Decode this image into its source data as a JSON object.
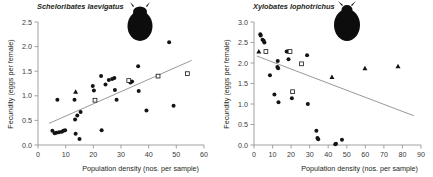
{
  "figure": {
    "panels": [
      {
        "id": "left",
        "title": "Scheloribates laevigatus",
        "icon_name": "mite-silhouette-icon",
        "chart_data": {
          "type": "scatter",
          "title": "Scheloribates laevigatus",
          "xlabel": "Population density (nos. per sample)",
          "ylabel": "Fecundity (eggs per female)",
          "xlim": [
            0,
            60
          ],
          "ylim": [
            0,
            2.5
          ],
          "xticks": [
            0,
            10,
            20,
            30,
            40,
            50,
            60
          ],
          "yticks": [
            "0.0",
            "0.5",
            "1.0",
            "1.5",
            "2.0",
            "2.5"
          ],
          "grid": false,
          "legend": "none",
          "series": [
            {
              "name": "circles",
              "marker": "filled-circle",
              "points": [
                [
                  5.2,
                  0.29
                ],
                [
                  6.0,
                  0.24
                ],
                [
                  6.6,
                  0.25
                ],
                [
                  7.0,
                  0.92
                ],
                [
                  7.6,
                  0.26
                ],
                [
                  8.6,
                  0.27
                ],
                [
                  9.2,
                  0.29
                ],
                [
                  9.8,
                  0.3
                ],
                [
                  13.2,
                  0.92
                ],
                [
                  13.4,
                  0.52
                ],
                [
                  13.6,
                  0.23
                ],
                [
                  14.2,
                  0.6
                ],
                [
                  15.0,
                  0.12
                ],
                [
                  15.4,
                  0.67
                ],
                [
                  19.8,
                  1.2
                ],
                [
                  20.2,
                  1.11
                ],
                [
                  22.8,
                  1.4
                ],
                [
                  23.0,
                  0.3
                ],
                [
                  24.4,
                  1.23
                ],
                [
                  25.6,
                  1.32
                ],
                [
                  26.8,
                  1.34
                ],
                [
                  27.6,
                  1.36
                ],
                [
                  27.8,
                  1.12
                ],
                [
                  28.4,
                  0.92
                ],
                [
                  33.4,
                  1.27
                ],
                [
                  34.0,
                  1.29
                ],
                [
                  36.2,
                  1.6
                ],
                [
                  36.4,
                  1.1
                ],
                [
                  39.2,
                  0.7
                ],
                [
                  47.4,
                  2.09
                ],
                [
                  49.0,
                  0.8
                ]
              ]
            },
            {
              "name": "triangles",
              "marker": "filled-triangle",
              "points": [
                [
                  13.6,
                  1.08
                ]
              ]
            },
            {
              "name": "squares",
              "marker": "open-square",
              "points": [
                [
                  20.6,
                  0.91
                ],
                [
                  32.8,
                  1.31
                ],
                [
                  43.4,
                  1.4
                ],
                [
                  54.0,
                  1.45
                ]
              ]
            }
          ],
          "trendline": {
            "x0": 4.0,
            "y0": 0.44,
            "x1": 55.5,
            "y1": 1.72,
            "slope": "positive"
          }
        }
      },
      {
        "id": "right",
        "title": "Xylobates lophotrichus",
        "icon_name": "mite-silhouette-icon",
        "chart_data": {
          "type": "scatter",
          "title": "Xylobates lophotrichus",
          "xlabel": "Population density (nos. per sample)",
          "ylabel": "Fecundity (eggs per female)",
          "xlim": [
            0,
            90
          ],
          "ylim": [
            0,
            3.0
          ],
          "xticks": [
            0,
            10,
            20,
            30,
            40,
            50,
            60,
            70,
            80,
            90
          ],
          "yticks": [
            "0.0",
            "0.5",
            "1.0",
            "1.5",
            "2.0",
            "2.5",
            "3.0"
          ],
          "grid": false,
          "legend": "none",
          "series": [
            {
              "name": "circles",
              "marker": "filled-circle",
              "points": [
                [
                  3.4,
                  2.7
                ],
                [
                  3.6,
                  2.67
                ],
                [
                  4.6,
                  2.57
                ],
                [
                  5.2,
                  2.54
                ],
                [
                  5.6,
                  2.5
                ],
                [
                  8.6,
                  1.7
                ],
                [
                  11.0,
                  1.23
                ],
                [
                  12.6,
                  1.9
                ],
                [
                  12.8,
                  2.05
                ],
                [
                  13.0,
                  1.87
                ],
                [
                  13.2,
                  1.04
                ],
                [
                  17.6,
                  2.28
                ],
                [
                  18.2,
                  2.28
                ],
                [
                  18.6,
                  2.09
                ],
                [
                  20.4,
                  1.14
                ],
                [
                  28.6,
                  2.19
                ],
                [
                  29.0,
                  1.0
                ],
                [
                  33.6,
                  0.35
                ],
                [
                  34.2,
                  0.17
                ],
                [
                  34.6,
                  0.14
                ],
                [
                  43.8,
                  0.02
                ],
                [
                  44.2,
                  0.03
                ],
                [
                  47.4,
                  0.13
                ]
              ]
            },
            {
              "name": "triangles",
              "marker": "filled-triangle",
              "points": [
                [
                  2.6,
                  2.28
                ],
                [
                  42.0,
                  1.66
                ],
                [
                  59.8,
                  1.87
                ],
                [
                  77.6,
                  1.92
                ]
              ]
            },
            {
              "name": "squares",
              "marker": "open-square",
              "points": [
                [
                  6.4,
                  2.28
                ],
                [
                  19.4,
                  2.28
                ],
                [
                  20.8,
                  1.3
                ],
                [
                  25.6,
                  1.98
                ]
              ]
            }
          ],
          "trendline": {
            "x0": 1.5,
            "y0": 2.17,
            "x1": 86.0,
            "y1": 0.42,
            "slope": "negative"
          }
        }
      }
    ]
  }
}
